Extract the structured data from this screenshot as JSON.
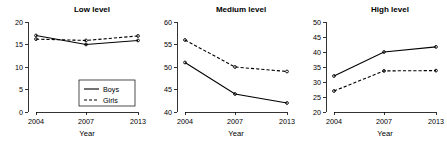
{
  "figure": {
    "background": "#ffffff",
    "line_color": "#000000",
    "panel_count": 3
  },
  "legend": {
    "position": "bottom-right of first panel",
    "entries": [
      {
        "label": "Boys",
        "style": "solid"
      },
      {
        "label": "Girls",
        "style": "dashed"
      }
    ]
  },
  "chart_data": [
    {
      "type": "line",
      "title": "Low level",
      "xlabel": "Year",
      "ylabel": "",
      "categories": [
        "2004",
        "2007",
        "2013"
      ],
      "x": [
        2004,
        2007,
        2013
      ],
      "ylim": [
        0,
        20
      ],
      "yticks": [
        0,
        5,
        10,
        15,
        20
      ],
      "xticks": [
        "2004",
        "2007",
        "2013"
      ],
      "grid": false,
      "legend": "bottom-right",
      "series": [
        {
          "name": "Boys",
          "style": "solid",
          "values": [
            17.0,
            15.0,
            15.9
          ]
        },
        {
          "name": "Girls",
          "style": "dashed",
          "values": [
            16.2,
            15.9,
            16.9
          ]
        }
      ]
    },
    {
      "type": "line",
      "title": "Medium level",
      "xlabel": "Year",
      "ylabel": "",
      "categories": [
        "2004",
        "2007",
        "2013"
      ],
      "x": [
        2004,
        2007,
        2013
      ],
      "ylim": [
        40,
        60
      ],
      "yticks": [
        40,
        45,
        50,
        55,
        60
      ],
      "xticks": [
        "2004",
        "2007",
        "2013"
      ],
      "grid": false,
      "legend": "none",
      "series": [
        {
          "name": "Boys",
          "style": "solid",
          "values": [
            51.0,
            44.0,
            42.0
          ]
        },
        {
          "name": "Girls",
          "style": "dashed",
          "values": [
            56.0,
            50.0,
            49.0
          ]
        }
      ]
    },
    {
      "type": "line",
      "title": "High level",
      "xlabel": "Year",
      "ylabel": "",
      "categories": [
        "2004",
        "2007",
        "2013"
      ],
      "x": [
        2004,
        2007,
        2013
      ],
      "ylim": [
        20,
        50
      ],
      "yticks": [
        20,
        25,
        30,
        35,
        40,
        45,
        50
      ],
      "xticks": [
        "2004",
        "2007",
        "2013"
      ],
      "grid": false,
      "legend": "none",
      "series": [
        {
          "name": "Boys",
          "style": "solid",
          "values": [
            32.0,
            40.0,
            41.7
          ]
        },
        {
          "name": "Girls",
          "style": "dashed",
          "values": [
            27.0,
            33.7,
            33.8
          ]
        }
      ]
    }
  ]
}
